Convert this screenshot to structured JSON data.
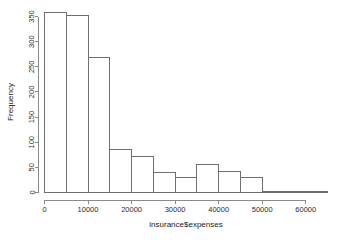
{
  "chart_data": {
    "type": "bar",
    "title": "",
    "subtitle": "",
    "xlabel": "insurance$expenses",
    "ylabel": "Frequency",
    "grid": false,
    "legend": null,
    "legend_position": "none",
    "bin_width": 5000,
    "xlim": [
      0,
      65000
    ],
    "ylim": [
      0,
      360
    ],
    "xticks": [
      0,
      10000,
      20000,
      30000,
      40000,
      50000,
      60000
    ],
    "xtick_labels": [
      "0",
      "10000",
      "20000",
      "30000",
      "40000",
      "50000",
      "60000"
    ],
    "yticks": [
      0,
      50,
      100,
      150,
      200,
      250,
      300,
      350
    ],
    "ytick_labels": [
      "0",
      "50",
      "100",
      "150",
      "200",
      "250",
      "300",
      "350"
    ],
    "bin_edges": [
      0,
      5000,
      10000,
      15000,
      20000,
      25000,
      30000,
      35000,
      40000,
      45000,
      50000,
      55000,
      60000,
      65000
    ],
    "categories": [
      "0-5000",
      "5000-10000",
      "10000-15000",
      "15000-20000",
      "20000-25000",
      "25000-30000",
      "30000-35000",
      "35000-40000",
      "40000-45000",
      "45000-50000",
      "50000-55000",
      "55000-60000",
      "60000-65000"
    ],
    "values": [
      358,
      352,
      268,
      85,
      72,
      39,
      29,
      55,
      41,
      30,
      2,
      1,
      2
    ],
    "bar_fill": "#ffffff",
    "bar_stroke": "#6f6f6f",
    "axis_color": "#8a8a8a"
  }
}
